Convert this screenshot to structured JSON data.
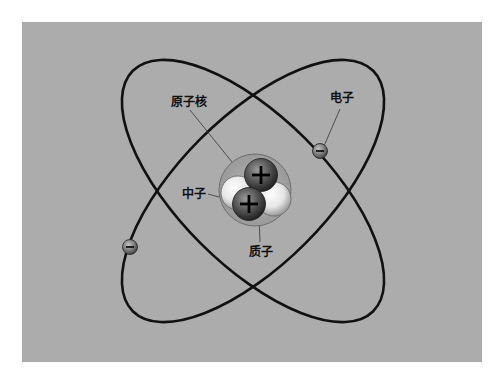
{
  "diagram": {
    "background_color": "#acacac",
    "labels": {
      "nucleus": "原子核",
      "electron": "电子",
      "neutron": "中子",
      "proton": "质子"
    },
    "symbols": {
      "proton_charge": "+",
      "electron_charge": "−"
    },
    "orbits": [
      {
        "name": "orbit-1",
        "cx": 253,
        "cy": 191,
        "rx": 170,
        "ry": 74,
        "rotation": 45
      },
      {
        "name": "orbit-2",
        "cx": 253,
        "cy": 191,
        "rx": 170,
        "ry": 74,
        "rotation": -45
      }
    ],
    "electrons": [
      {
        "name": "electron-right",
        "x": 320,
        "y": 151
      },
      {
        "name": "electron-left",
        "x": 130,
        "y": 247
      }
    ],
    "colors": {
      "orbit": "#111111",
      "proton": "#555555",
      "neutron": "#f4f4f4",
      "electron": "#7a7a7a",
      "nucleus_shell": "#9a9a9a"
    }
  }
}
